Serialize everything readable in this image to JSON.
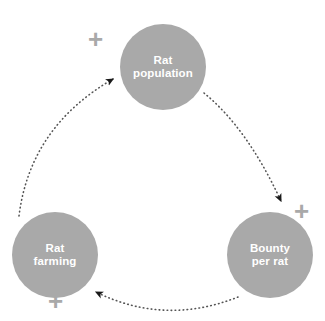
{
  "diagram": {
    "type": "causal-loop-diagram",
    "background_color": "#ffffff",
    "node_color": "#a9a9a9",
    "node_text_color": "#ffffff",
    "arrow_color": "#1a1a1a",
    "link_style": "dotted",
    "sign_color": "#a9a9a9",
    "nodes": [
      {
        "id": "rat-population",
        "label": "Rat\npopulation",
        "cx": 163,
        "cy": 67
      },
      {
        "id": "rat-farming",
        "label": "Rat\nfarming",
        "cx": 55,
        "cy": 255
      },
      {
        "id": "bounty-per-rat",
        "label": "Bounty\nper rat",
        "cx": 270,
        "cy": 255
      }
    ],
    "links": [
      {
        "from": "rat-population",
        "to": "bounty-per-rat",
        "sign": "+"
      },
      {
        "from": "bounty-per-rat",
        "to": "rat-farming",
        "sign": "+"
      },
      {
        "from": "rat-farming",
        "to": "rat-population",
        "sign": "+"
      }
    ],
    "signs": {
      "top_left": "+",
      "right": "+",
      "bottom_left": "+"
    }
  }
}
